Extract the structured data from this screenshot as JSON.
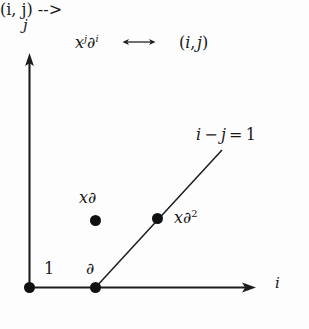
{
  "figure": {
    "type": "mathematical-lattice-diagram",
    "background_color": "#fdfdfd",
    "ink_color": "#191919"
  },
  "axes": {
    "x": {
      "label": "i",
      "from": [
        29,
        288
      ],
      "to": [
        255,
        288
      ],
      "arrowhead": true
    },
    "y": {
      "label": "j",
      "from": [
        29,
        288
      ],
      "to": [
        29,
        55
      ],
      "arrowhead": true
    }
  },
  "correspondence": {
    "left_base": "x",
    "left_exponent": "j",
    "left_operator": "∂",
    "left_operator_exponent": "i",
    "arrow": "⟷",
    "right": "(i, j)",
    "right_open": "(",
    "right_first": "i",
    "right_comma": ",",
    "right_second": "j",
    "right_close": ")"
  },
  "line": {
    "label_i": "i",
    "label_minus": "−",
    "label_j": "j",
    "label_equals": "=",
    "label_value": "1",
    "equation": "i − j = 1",
    "from": [
      95,
      288
    ],
    "to": [
      222,
      150
    ]
  },
  "points": [
    {
      "name": "identity",
      "label": "1",
      "coords": [
        0,
        0
      ],
      "label_position": "above-right"
    },
    {
      "name": "partial",
      "label": "∂",
      "coords": [
        1,
        0
      ],
      "label_position": "above"
    },
    {
      "name": "x-partial",
      "label_base": "x",
      "label_operator": "∂",
      "label": "x∂",
      "coords": [
        1,
        1
      ],
      "label_position": "above"
    },
    {
      "name": "x-partial-squared",
      "label_base": "x",
      "label_operator": "∂",
      "label_exponent": "2",
      "label": "x∂²",
      "coords": [
        2,
        1
      ],
      "label_position": "right"
    }
  ]
}
